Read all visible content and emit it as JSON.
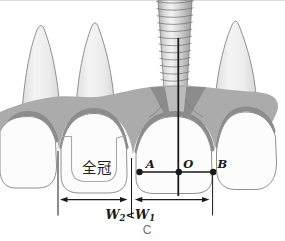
{
  "figure": {
    "caption": "C",
    "teeth": {
      "crown_label": "全冠"
    },
    "points": {
      "a": "A",
      "o": "O",
      "b": "B"
    },
    "dimension": {
      "left_letter": "W",
      "left_sub": "2",
      "comparator": "<",
      "right_letter": "W",
      "right_sub": "1"
    },
    "colors": {
      "gum": "#ababab",
      "gum_dark": "#8c8c8c",
      "crown": "#fcfcfc",
      "outline": "#8f8f8f",
      "line": "#1a1a1a",
      "caption": "#707070"
    }
  }
}
